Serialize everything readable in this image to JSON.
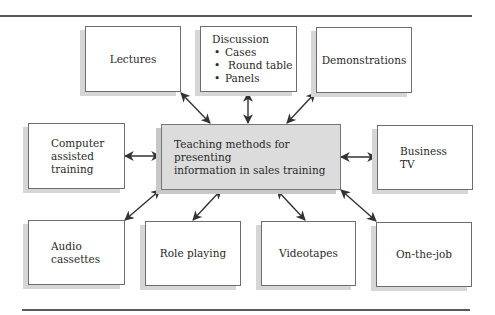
{
  "diagram": {
    "center": {
      "label_lines": [
        "Teaching methods for presenting",
        "information in sales training"
      ]
    },
    "nodes": {
      "lectures": {
        "label": "Lectures"
      },
      "discussion": {
        "title": "Discussion",
        "items": [
          "Cases",
          "Round table",
          "Panels"
        ]
      },
      "demonstrations": {
        "label": "Demonstrations"
      },
      "computer_assisted": {
        "label_lines": [
          "Computer",
          "assisted",
          "training"
        ]
      },
      "business_tv": {
        "label_lines": [
          "Business",
          "TV"
        ]
      },
      "audio_cassettes": {
        "label_lines": [
          "Audio",
          "cassettes"
        ]
      },
      "role_playing": {
        "label": "Role playing"
      },
      "videotapes": {
        "label": "Videotapes"
      },
      "on_the_job": {
        "label": "On-the-job"
      }
    },
    "connectors": "bidirectional arrows from center to each node",
    "colors": {
      "center_fill": "#dcdcdc",
      "box_fill": "#ffffff",
      "border": "#6e6e6e",
      "shadow": "#d6d6d6",
      "arrow": "#333333",
      "rule": "#5a5a5a"
    }
  }
}
